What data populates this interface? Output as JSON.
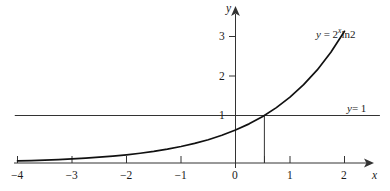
{
  "figure": {
    "background_color": "#ffffff",
    "ink_color": "#1a1a1a",
    "curve_color": "#111111",
    "line_color": "#333333"
  },
  "axes": {
    "x_axis_name": "x",
    "y_axis_name": "y",
    "x_tick_labels": [
      "−4",
      "−3",
      "−2",
      "−1",
      "0",
      "1",
      "2"
    ],
    "y_tick_labels": [
      "1",
      "2",
      "3"
    ]
  },
  "annotations": {
    "curve_label_lhs": "y",
    "curve_label_equals": "=",
    "curve_label_base": "2",
    "curve_label_exponent": "x",
    "curve_label_rest": "ln2",
    "curve_label_full": "y = 2ˣln2",
    "hline_label_lhs": "y",
    "hline_label_rest": "= 1",
    "hline_label_full": "y= 1"
  },
  "chart_data": {
    "type": "line",
    "title": "",
    "xlabel": "x",
    "ylabel": "y",
    "xlim": [
      -4.4,
      2.6
    ],
    "ylim": [
      -0.22,
      3.45
    ],
    "xticks": [
      -4,
      -3,
      -2,
      -1,
      0,
      1,
      2
    ],
    "yticks": [
      1,
      2,
      3
    ],
    "grid": false,
    "legend": "none",
    "series": [
      {
        "name": "y = 2^x ln2",
        "expression": "y = 2^x * ln(2)",
        "label_position": "upper-right",
        "x": [
          -4,
          -3.75,
          -3.5,
          -3.25,
          -3,
          -2.75,
          -2.5,
          -2.25,
          -2,
          -1.75,
          -1.5,
          -1.25,
          -1,
          -0.75,
          -0.5,
          -0.25,
          0,
          0.25,
          0.5,
          0.75,
          1,
          1.25,
          1.5,
          1.75,
          2
        ],
        "values": [
          0.043,
          0.052,
          0.061,
          0.073,
          0.087,
          0.103,
          0.123,
          0.146,
          0.173,
          0.206,
          0.245,
          0.292,
          0.347,
          0.412,
          0.49,
          0.583,
          0.693,
          0.824,
          0.98,
          1.166,
          1.386,
          1.649,
          1.96,
          2.332,
          2.773
        ]
      },
      {
        "name": "y = 1",
        "expression": "y = 1",
        "type": "horizontal-line",
        "y_value": 1,
        "x_start": -4.05,
        "x_end": 2.65,
        "label_position": "right"
      }
    ],
    "markers": [
      {
        "name": "intersection-dropline",
        "type": "vertical-segment",
        "x": 0.53,
        "y_from": 0,
        "y_to": 1,
        "description": "vertical line from x-axis up to intersection of curve with y = 1"
      }
    ],
    "annotations": [
      {
        "text": "y = 2ˣln2",
        "x": 1.45,
        "y": 3.1
      },
      {
        "text": "y= 1",
        "x": 2.15,
        "y": 1.25
      }
    ]
  }
}
